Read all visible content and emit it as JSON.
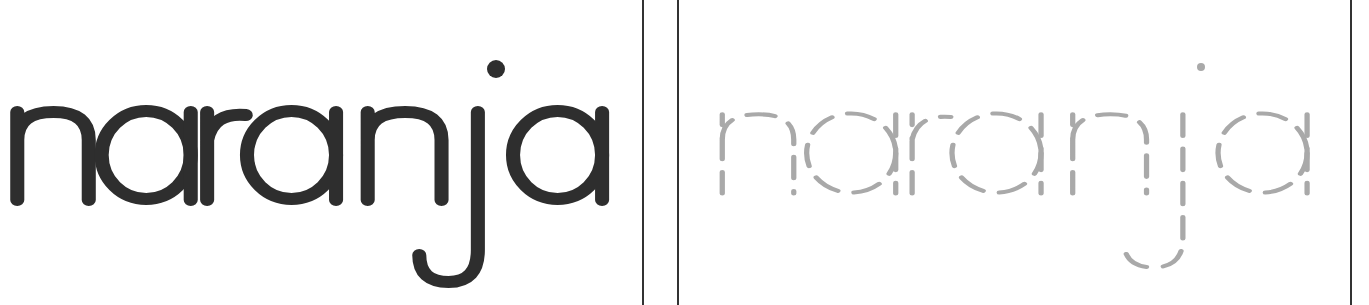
{
  "word": "naranja",
  "panels": [
    {
      "name": "solid-word",
      "style": "solid",
      "color": "#2e2e2e"
    },
    {
      "name": "traceable-word",
      "style": "dashed",
      "color": "#a9a9a9"
    }
  ],
  "divider_color": "#333333"
}
